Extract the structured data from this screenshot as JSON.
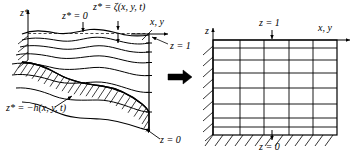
{
  "figure": {
    "type": "coordinate-transformation-diagram",
    "transform_arrow": "right-arrow"
  },
  "left_panel": {
    "name": "physical-domain",
    "vertical_axis_label": "z*",
    "horizontal_axis_label": "x, y",
    "free_surface_label": "z* = ζ(x, y, t)",
    "still_level_label": "z* = 0",
    "bottom_label": "z* = −h(x, y, t)",
    "top_mapped_label": "z = 1",
    "bottom_mapped_label": "z = 0",
    "layer_count": 7,
    "has_hatching": true
  },
  "right_panel": {
    "name": "computational-domain",
    "vertical_axis_label": "z",
    "horizontal_axis_label": "x, y",
    "top_label": "z = 1",
    "bottom_label": "z = 0",
    "grid_columns": 5,
    "grid_rows": 7,
    "has_hatching": true
  },
  "colors": {
    "line": "#000000",
    "background": "#ffffff",
    "arrow": "#000000"
  }
}
